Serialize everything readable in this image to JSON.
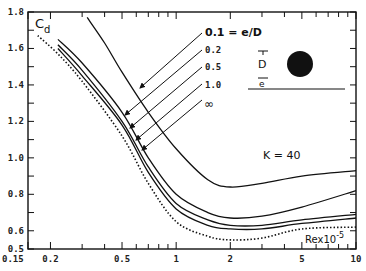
{
  "chart_data": {
    "type": "line",
    "title": "",
    "xlabel": "Re x 10^-5",
    "ylabel": "C_d",
    "xscale": "log",
    "xlim": [
      0.15,
      10
    ],
    "ylim": [
      0.5,
      1.8
    ],
    "x_ticks": [
      0.15,
      0.2,
      0.5,
      1,
      2,
      5,
      10
    ],
    "x_tick_labels": [
      "0.15",
      "0.2",
      "0.5",
      "1",
      "2",
      "5",
      "10"
    ],
    "y_ticks": [
      0.5,
      0.6,
      0.8,
      1.0,
      1.2,
      1.4,
      1.6,
      1.8
    ],
    "y_tick_labels": [
      "0.5",
      "0.6",
      "0.8",
      "1.0",
      "1.2",
      "1.4",
      "1.6",
      "1.8"
    ],
    "grid": false,
    "annotations": [
      "K = 40",
      "0.1 = e/D",
      "0.2",
      "0.5",
      "1.0",
      "∞",
      "D",
      "e",
      "Re x 10^-5",
      "C_d"
    ],
    "legend_position": "upper-right (arrow labels)",
    "series": [
      {
        "name": "e/D = 0.1",
        "style": "solid",
        "x": [
          0.32,
          0.4,
          0.5,
          0.7,
          1.0,
          1.5,
          2.0,
          3.0,
          5.0,
          10.0
        ],
        "y": [
          1.77,
          1.63,
          1.47,
          1.25,
          1.05,
          0.88,
          0.84,
          0.86,
          0.9,
          0.93
        ]
      },
      {
        "name": "e/D = 0.2",
        "style": "solid",
        "x": [
          0.22,
          0.3,
          0.5,
          0.7,
          1.0,
          1.5,
          2.0,
          3.0,
          5.0,
          10.0
        ],
        "y": [
          1.65,
          1.52,
          1.25,
          1.0,
          0.8,
          0.7,
          0.67,
          0.68,
          0.73,
          0.82
        ]
      },
      {
        "name": "e/D = 0.5",
        "style": "solid",
        "x": [
          0.22,
          0.3,
          0.5,
          0.7,
          1.0,
          1.5,
          2.0,
          3.0,
          5.0,
          10.0
        ],
        "y": [
          1.62,
          1.48,
          1.2,
          0.95,
          0.75,
          0.66,
          0.63,
          0.63,
          0.66,
          0.69
        ]
      },
      {
        "name": "e/D = 1.0",
        "style": "solid",
        "x": [
          0.22,
          0.3,
          0.5,
          0.7,
          1.0,
          1.5,
          2.0,
          3.0,
          5.0,
          10.0
        ],
        "y": [
          1.6,
          1.45,
          1.18,
          0.92,
          0.72,
          0.63,
          0.61,
          0.61,
          0.64,
          0.67
        ]
      },
      {
        "name": "e/D = ∞",
        "style": "dotted",
        "x": [
          0.17,
          0.22,
          0.3,
          0.5,
          0.7,
          1.0,
          1.5,
          2.0,
          3.0,
          5.0,
          10.0
        ],
        "y": [
          1.67,
          1.57,
          1.42,
          1.12,
          0.86,
          0.65,
          0.57,
          0.55,
          0.56,
          0.61,
          0.62
        ]
      }
    ]
  },
  "labels": {
    "cd": "C",
    "cd_sub": "d",
    "k": "K = 40",
    "re": "Rex10",
    "re_exp": "-5",
    "ed_01": "0.1 = e/D",
    "ed_02": "0.2",
    "ed_05": "0.5",
    "ed_10": "1.0",
    "ed_inf": "∞",
    "d": "D",
    "e": "e"
  }
}
